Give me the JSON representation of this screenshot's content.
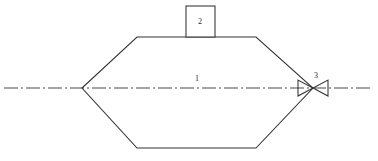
{
  "diagram": {
    "background_color": "#ffffff",
    "line_color": "#333333",
    "centerline_color": "#4a4a4a",
    "text_color": "#2b2b2b",
    "callouts": [
      {
        "id": "vessel",
        "label": "1",
        "x": 197,
        "y": 81,
        "refers_to": "hexagonal vessel body"
      },
      {
        "id": "top-fitting",
        "label": "2",
        "x": 200,
        "y": 24,
        "refers_to": "rectangular fitting on vessel top"
      },
      {
        "id": "valve",
        "label": "3",
        "x": 316,
        "y": 78,
        "refers_to": "bowtie valve symbol"
      }
    ],
    "geometry": {
      "vessel_outline_points": "82,88 137,37 256,37 313,88 256,148 137,148",
      "top_fitting_rect": {
        "x": 186,
        "y": 6,
        "width": 29,
        "height": 31
      },
      "centerline": {
        "x1": 4,
        "y1": 88,
        "x2": 373,
        "y2": 88,
        "dash_pattern": "14,3,2,3"
      },
      "valve_left_triangle": "298,80 298,96 313,88",
      "valve_right_triangle": "328,80 328,96 313,88"
    }
  }
}
